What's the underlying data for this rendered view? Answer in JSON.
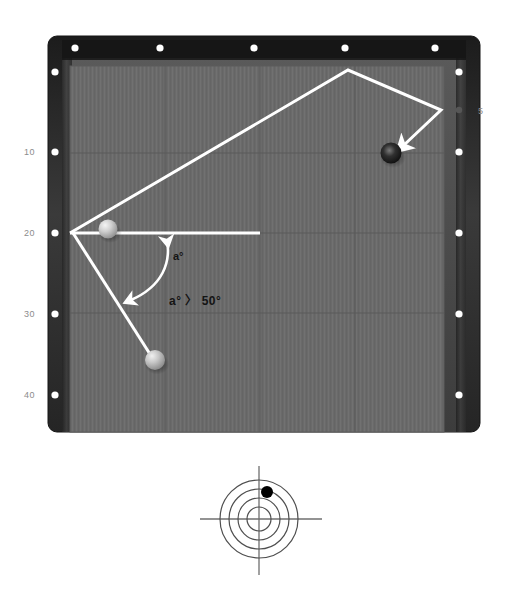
{
  "scene": {
    "title": "Billiard table bank shot diagram",
    "background_color": "#ffffff"
  },
  "table": {
    "name": "pool-table",
    "outer_rect": {
      "x": 48,
      "y": 36,
      "w": 432,
      "h": 396
    },
    "rail_color": "#2b2b2b",
    "rail_inner_color": "#4a4a4a",
    "cloth_color": "#6a6a6a",
    "cloth_rect": {
      "x": 70,
      "y": 66,
      "w": 374,
      "h": 366
    },
    "grid_color": "#5a5a5a",
    "grid_vertical_x": [
      165,
      260,
      355
    ],
    "grid_horizontal_y": [
      153,
      233,
      313
    ],
    "diamond_color": "#ffffff",
    "diamonds": {
      "top": [
        {
          "x": 75,
          "y": 48
        },
        {
          "x": 160,
          "y": 48
        },
        {
          "x": 254,
          "y": 48
        },
        {
          "x": 345,
          "y": 48
        },
        {
          "x": 435,
          "y": 48
        }
      ],
      "left": [
        {
          "x": 55,
          "y": 72
        },
        {
          "x": 55,
          "y": 152
        },
        {
          "x": 55,
          "y": 233
        },
        {
          "x": 55,
          "y": 314
        },
        {
          "x": 55,
          "y": 395
        }
      ],
      "right": [
        {
          "x": 459,
          "y": 72
        },
        {
          "x": 459,
          "y": 152
        },
        {
          "x": 459,
          "y": 233
        },
        {
          "x": 459,
          "y": 314
        },
        {
          "x": 459,
          "y": 395
        }
      ]
    },
    "rail_marker": {
      "name": "rail-marker-5",
      "x": 459,
      "y": 110,
      "color": "#4f4f4f"
    }
  },
  "axis_labels": {
    "left": [
      {
        "text": "10",
        "x": 24,
        "y": 147
      },
      {
        "text": "20",
        "x": 24,
        "y": 228
      },
      {
        "text": "30",
        "x": 24,
        "y": 309
      },
      {
        "text": "40",
        "x": 24,
        "y": 390
      }
    ],
    "right": [
      {
        "text": "5",
        "x": 478,
        "y": 106
      }
    ]
  },
  "balls": [
    {
      "name": "cue-ball",
      "x": 108,
      "y": 229,
      "r": 9.5,
      "color": "#c9c9c9",
      "highlight": "#f2f2f2"
    },
    {
      "name": "object-ball-light",
      "x": 155,
      "y": 360,
      "r": 10,
      "color": "#c4c4c4",
      "highlight": "#efefef"
    },
    {
      "name": "object-ball-dark",
      "x": 391,
      "y": 153,
      "r": 10.5,
      "color": "#1c1c1c",
      "highlight": "#6e6e6e"
    }
  ],
  "shot_path": {
    "name": "bank-shot-path",
    "color": "#ffffff",
    "width": 3,
    "points": [
      {
        "x": 70,
        "y": 233
      },
      {
        "x": 348,
        "y": 70
      },
      {
        "x": 441,
        "y": 110
      },
      {
        "x": 402,
        "y": 144
      }
    ],
    "arrowhead_at_end": true
  },
  "reference_line": {
    "name": "horizontal-reference-line",
    "color": "#ffffff",
    "width": 3,
    "from": {
      "x": 70,
      "y": 233
    },
    "to": {
      "x": 260,
      "y": 233
    }
  },
  "aim_line": {
    "name": "cue-aim-line",
    "color": "#ffffff",
    "width": 3,
    "from": {
      "x": 103,
      "y": 234
    },
    "to": {
      "x": 152,
      "y": 352
    }
  },
  "angle_arc": {
    "name": "angle-arc-arrow",
    "color": "#ffffff",
    "width": 2.5,
    "double_headed": true,
    "start": {
      "x": 167,
      "y": 238
    },
    "end": {
      "x": 125,
      "y": 303
    }
  },
  "annotations": [
    {
      "name": "angle-label",
      "text": "a°",
      "x": 173,
      "y": 253
    },
    {
      "name": "angle-condition-label",
      "text": "a° 〉 50°",
      "x": 169,
      "y": 294
    }
  ],
  "spin_target": {
    "name": "cue-ball-contact-diagram",
    "center": {
      "x": 259,
      "y": 519
    },
    "radii": [
      12,
      21,
      30,
      39
    ],
    "circle_color": "#4a4a4a",
    "crosshair_color": "#6a6a6a",
    "crosshair_v": {
      "x": 259,
      "y1": 466,
      "y2": 575
    },
    "crosshair_h": {
      "y": 519,
      "x1": 200,
      "x2": 322
    },
    "contact_dot": {
      "x": 267,
      "y": 492,
      "r": 6,
      "color": "#000000"
    }
  }
}
